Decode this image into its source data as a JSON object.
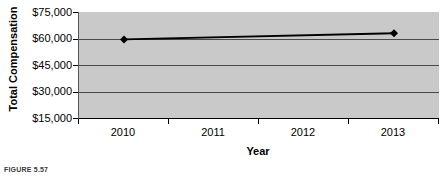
{
  "figure": {
    "caption": "FIGURE 5.57"
  },
  "chart_data": {
    "type": "line",
    "title": "",
    "xlabel": "Year",
    "ylabel": "Total Compensation",
    "categories": [
      "2010",
      "2011",
      "2012",
      "2013"
    ],
    "x_tick_labels": [
      "2010",
      "2011",
      "2012",
      "2013"
    ],
    "y_tick_labels": [
      "$75,000",
      "$60,000",
      "$45,000",
      "$30,000",
      "$15,000"
    ],
    "y_tick_values": [
      75000,
      60000,
      45000,
      30000,
      15000
    ],
    "ylim": [
      15000,
      75000
    ],
    "grid": true,
    "legend": false,
    "marker": "diamond",
    "line_color": "#000000",
    "marker_color": "#000000",
    "plot_background": "#c9c9c9",
    "series": [
      {
        "name": "Total Compensation",
        "points": [
          {
            "x": "2010",
            "y": 59500
          },
          {
            "x": "2013",
            "y": 63000
          }
        ],
        "values": [
          59500,
          null,
          null,
          63000
        ]
      }
    ]
  }
}
